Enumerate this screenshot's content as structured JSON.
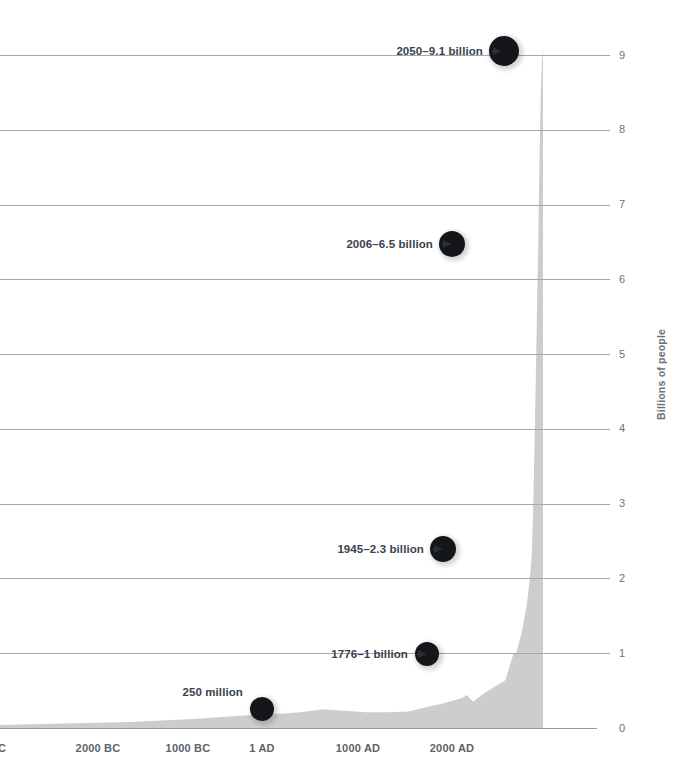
{
  "chart_data": {
    "type": "area",
    "title": "",
    "subtitle": "",
    "xlabel": "",
    "ylabel": "Billions of people",
    "ylim": [
      0,
      9.4
    ],
    "xlim": [
      -3000,
      2050
    ],
    "grid": true,
    "legend": "none",
    "fill_color": "#cdcdcd",
    "gridline_color": "#a8a8a8",
    "annotation_color": "#39424e",
    "dot_color": "#14161a",
    "yticks": [
      "0",
      "1",
      "2",
      "3",
      "4",
      "5",
      "6",
      "7",
      "8",
      "9"
    ],
    "ytick_values": [
      0,
      1,
      2,
      3,
      4,
      5,
      6,
      7,
      8,
      9
    ],
    "xticks": [
      "C",
      "2000 BC",
      "1000 BC",
      "1 AD",
      "1000 AD",
      "2000 AD"
    ],
    "xtick_values": [
      -3000,
      -2000,
      -1000,
      1,
      1000,
      2000
    ],
    "x": [
      -3000,
      -2700,
      -2400,
      -2100,
      -1800,
      -1500,
      -1200,
      -1000,
      -800,
      -600,
      -400,
      -200,
      1,
      200,
      400,
      600,
      800,
      1000,
      1100,
      1200,
      1300,
      1340,
      1400,
      1500,
      1600,
      1700,
      1776,
      1800,
      1850,
      1900,
      1927,
      1945,
      1960,
      1974,
      1987,
      1999,
      2006,
      2011,
      2020,
      2030,
      2040,
      2050
    ],
    "values": [
      0.04,
      0.05,
      0.06,
      0.07,
      0.08,
      0.1,
      0.12,
      0.14,
      0.16,
      0.18,
      0.19,
      0.21,
      0.25,
      0.23,
      0.21,
      0.21,
      0.22,
      0.29,
      0.32,
      0.36,
      0.4,
      0.44,
      0.35,
      0.46,
      0.55,
      0.64,
      1.0,
      1.0,
      1.26,
      1.65,
      2.0,
      2.3,
      3.0,
      4.0,
      5.0,
      6.0,
      6.5,
      7.0,
      7.8,
      8.5,
      8.9,
      9.1
    ],
    "annotations": [
      {
        "id": "ann-250-million",
        "label": "250 million",
        "x_value": 1,
        "y_value": 0.25,
        "has_arrow": false
      },
      {
        "id": "ann-1776",
        "label": "1776–1 billion",
        "x_value": 1776,
        "y_value": 1.0,
        "has_arrow": true
      },
      {
        "id": "ann-1945",
        "label": "1945–2.3 billion",
        "x_value": 1945,
        "y_value": 2.3,
        "has_arrow": true
      },
      {
        "id": "ann-2006",
        "label": "2006–6.5 billion",
        "x_value": 2006,
        "y_value": 6.5,
        "has_arrow": true
      },
      {
        "id": "ann-2050",
        "label": "2050–9.1 billion",
        "x_value": 2050,
        "y_value": 9.1,
        "has_arrow": true
      }
    ]
  }
}
